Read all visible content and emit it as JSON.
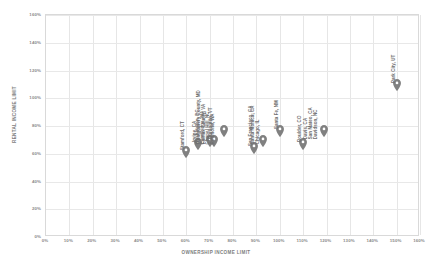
{
  "chart_data": {
    "type": "scatter",
    "title": "",
    "xlabel": "OWNERSHIP INCOME LIMIT",
    "ylabel": "RENTAL INCOME LIMIT",
    "xlim": [
      0,
      160
    ],
    "ylim": [
      0,
      160
    ],
    "xticks": [
      "0%",
      "10%",
      "20%",
      "30%",
      "40%",
      "50%",
      "60%",
      "70%",
      "80%",
      "90%",
      "100%",
      "110%",
      "120%",
      "130%",
      "140%",
      "150%",
      "160%"
    ],
    "yticks": [
      "0%",
      "20%",
      "40%",
      "60%",
      "80%",
      "100%",
      "120%",
      "140%",
      "160%"
    ],
    "grid": true,
    "legend": "none",
    "marker": "map-pin",
    "marker_color": "#808080",
    "points": [
      {
        "label": [
          "Stamford, CT"
        ],
        "x": 60,
        "y": 57
      },
      {
        "label": [
          "Irvine, CA"
        ],
        "x": 65,
        "y": 63
      },
      {
        "label": [
          "Montgomery County, MD",
          "Fairfax County, VA"
        ],
        "x": 70,
        "y": 65
      },
      {
        "label": [
          "Burlington, VT"
        ],
        "x": 72,
        "y": 65
      },
      {
        "label": [
          "Washington, DC",
          "Cambridge, MA",
          "Chapel Hill, NC",
          "Redmond, WA"
        ],
        "x": 76,
        "y": 72
      },
      {
        "label": [
          "San Francisco, CA"
        ],
        "x": 89,
        "y": 60
      },
      {
        "label": [
          "Santa Monica, CA",
          "Chicago, IL"
        ],
        "x": 93,
        "y": 65
      },
      {
        "label": [
          "Santa Fe, NM"
        ],
        "x": 100,
        "y": 72
      },
      {
        "label": [
          "Boulder, CO"
        ],
        "x": 110,
        "y": 63
      },
      {
        "label": [
          "Davis, CA",
          "San Mateo, CA",
          "Davidson, NC"
        ],
        "x": 119,
        "y": 72
      },
      {
        "label": [
          "Park City, UT"
        ],
        "x": 150,
        "y": 105
      }
    ]
  }
}
